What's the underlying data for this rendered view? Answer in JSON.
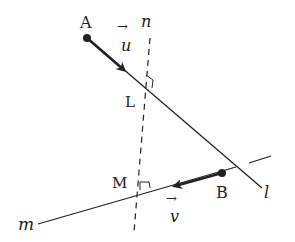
{
  "diagram": {
    "points": {
      "A": {
        "label": "A"
      },
      "B": {
        "label": "B"
      },
      "L": {
        "label": "L"
      },
      "M": {
        "label": "M"
      }
    },
    "lines": {
      "l": {
        "label": "l"
      },
      "m": {
        "label": "m"
      },
      "n": {
        "label": "n"
      }
    },
    "vectors": {
      "u": {
        "label": "u",
        "arrow": "→"
      },
      "v": {
        "label": "v",
        "arrow": "→"
      }
    },
    "colors": {
      "stroke": "#222222",
      "background": "#ffffff"
    }
  }
}
